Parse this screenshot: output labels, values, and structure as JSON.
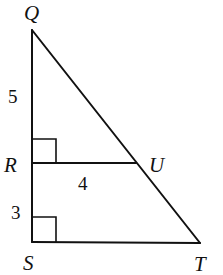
{
  "diagram": {
    "points": {
      "Q": {
        "label": "Q",
        "x": 32,
        "y": 30
      },
      "R": {
        "label": "R",
        "x": 32,
        "y": 163
      },
      "U": {
        "label": "U",
        "x": 136,
        "y": 163
      },
      "S": {
        "label": "S",
        "x": 32,
        "y": 242
      },
      "T": {
        "label": "T",
        "x": 200,
        "y": 243
      }
    },
    "segments": [
      {
        "from": "Q",
        "to": "S"
      },
      {
        "from": "S",
        "to": "T"
      },
      {
        "from": "Q",
        "to": "T"
      },
      {
        "from": "R",
        "to": "U"
      }
    ],
    "measures": {
      "QR": "5",
      "RU": "4",
      "RS": "3"
    },
    "right_angles": [
      "R",
      "S"
    ]
  }
}
